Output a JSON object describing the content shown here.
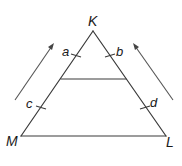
{
  "diagram": {
    "vertices": {
      "K": {
        "label": "K",
        "x": 93,
        "y": 31
      },
      "M": {
        "label": "M",
        "x": 21,
        "y": 136
      },
      "L": {
        "label": "L",
        "x": 166,
        "y": 136
      }
    },
    "parallel_segment": {
      "x1": 61,
      "y1": 79,
      "x2": 126,
      "y2": 79
    },
    "segment_labels": {
      "a": {
        "label": "a",
        "side": "KM upper part"
      },
      "b": {
        "label": "b",
        "side": "KL upper part"
      },
      "c": {
        "label": "c",
        "side": "KM lower part"
      },
      "d": {
        "label": "d",
        "side": "KL lower part"
      }
    },
    "arrows": [
      {
        "name": "left-arrow",
        "from": [
          15,
          100
        ],
        "to": [
          54,
          43
        ],
        "direction": "up-right"
      },
      {
        "name": "right-arrow",
        "from": [
          173,
          100
        ],
        "to": [
          133,
          43
        ],
        "direction": "up-left"
      }
    ],
    "colors": {
      "line": "#3a3a3a",
      "arrow": "#555555",
      "text": "#1a1a1a",
      "background": "#ffffff"
    }
  }
}
